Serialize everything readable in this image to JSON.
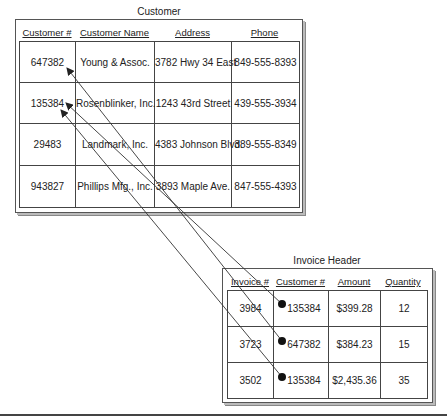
{
  "customer": {
    "title": "Customer",
    "columns": [
      "Customer #",
      "Customer Name",
      "Address",
      "Phone"
    ],
    "rows": [
      [
        "647382",
        "Young & Assoc.",
        "3782 Hwy 34 East",
        "849-555-8393"
      ],
      [
        "135384",
        "Rosenblinker, Inc.",
        "1243 43rd Street",
        "439-555-3934"
      ],
      [
        "29483",
        "Landmark, Inc.",
        "4383 Johnson Blvd.",
        "389-555-8349"
      ],
      [
        "943827",
        "Phillips Mfg., Inc.",
        "3893 Maple Ave.",
        "847-555-4393"
      ]
    ]
  },
  "invoice": {
    "title": "Invoice Header",
    "columns": [
      "Invoice #",
      "Customer #",
      "Amount",
      "Quantity"
    ],
    "rows": [
      [
        "3984",
        "135384",
        "$399.28",
        "12"
      ],
      [
        "3723",
        "647382",
        "$384.23",
        "15"
      ],
      [
        "3502",
        "135384",
        "$2,435.36",
        "35"
      ]
    ]
  },
  "links": [
    {
      "from": "invoice.rows.0.1",
      "to": "customer.rows.1.0"
    },
    {
      "from": "invoice.rows.1.1",
      "to": "customer.rows.0.0"
    },
    {
      "from": "invoice.rows.2.1",
      "to": "customer.rows.1.0"
    }
  ]
}
